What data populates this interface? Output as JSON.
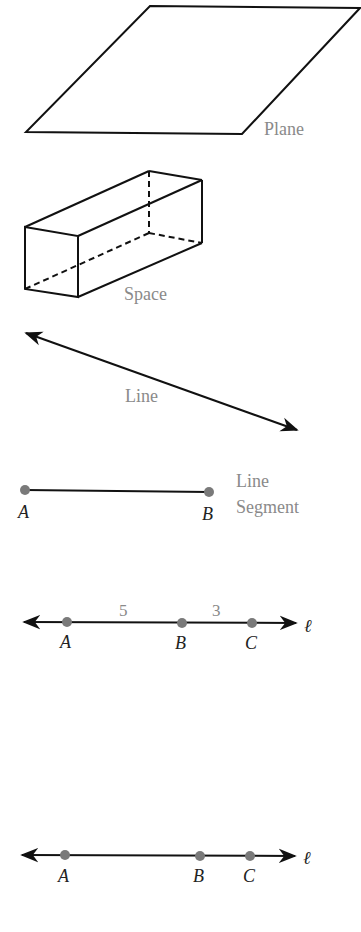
{
  "figures": {
    "plane": {
      "label": "Plane"
    },
    "space": {
      "label": "Space"
    },
    "line": {
      "label": "Line"
    },
    "segment": {
      "label_line1": "Line",
      "label_line2": "Segment",
      "point_a": "A",
      "point_b": "B"
    },
    "number_line_1": {
      "point_a": "A",
      "point_b": "B",
      "point_c": "C",
      "dist_ab": "5",
      "dist_bc": "3",
      "line_name": "ℓ"
    },
    "number_line_2": {
      "point_a": "A",
      "point_b": "B",
      "point_c": "C",
      "line_name": "ℓ"
    }
  },
  "colors": {
    "stroke": "#111111",
    "point": "#7a7a7a",
    "label": "#8a8a8a"
  }
}
